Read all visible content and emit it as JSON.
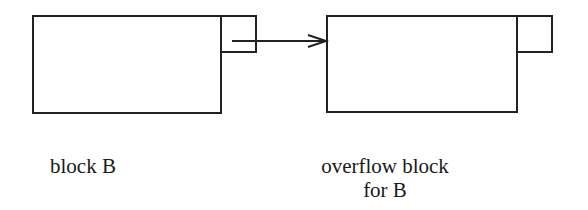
{
  "diagram": {
    "stroke_color": "#222222",
    "nodes": [
      {
        "id": "block-b",
        "label": "block B",
        "has_pointer_slot": true
      },
      {
        "id": "overflow-block",
        "label_line1": "overflow block",
        "label_line2": "for B",
        "has_pointer_slot": true
      }
    ],
    "edges": [
      {
        "from": "block-b.pointer-slot",
        "to": "overflow-block",
        "style": "arrow"
      }
    ]
  },
  "labels": {
    "block_b": "block B",
    "overflow_line1": "overflow block",
    "overflow_line2": "for B"
  }
}
